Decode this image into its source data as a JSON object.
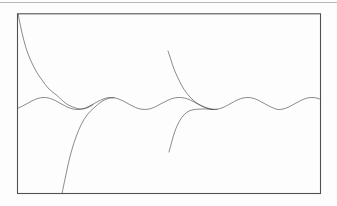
{
  "page": {
    "background": "#fdfdfd",
    "width": 337,
    "height": 206
  },
  "rule": {
    "x1": 0,
    "x2": 337,
    "y": 2.5,
    "color": "#b6b6b6",
    "width": 1
  },
  "figure_frame": {
    "x": 17.5,
    "y": 13.8,
    "width": 303,
    "height": 179.7,
    "stroke": "#515151",
    "stroke_width": 1.1
  },
  "chart_data": {
    "type": "line",
    "note": "Unlabeled line figure: periodic (sinusoidal) solution with four transient curves converging onto it; rectangular frame only, no axes, no ticks, no text.",
    "axes_visible": false,
    "grid": false,
    "legend": false,
    "units": "image pixels, y increases downward",
    "curve_color": "rgba(70,70,70,0.62)",
    "curve_width": 1,
    "series": [
      {
        "name": "periodic-solution",
        "points": [
          [
            18,
            108.1
          ],
          [
            23,
            105.8
          ],
          [
            28,
            103.1
          ],
          [
            33,
            100.4
          ],
          [
            38,
            98.4
          ],
          [
            43,
            97.5
          ],
          [
            48,
            97.9
          ],
          [
            53,
            99.5
          ],
          [
            58,
            102.0
          ],
          [
            63,
            104.8
          ],
          [
            68,
            107.3
          ],
          [
            73,
            109.0
          ],
          [
            78,
            109.5
          ],
          [
            83,
            108.7
          ],
          [
            88,
            106.8
          ],
          [
            93,
            104.2
          ],
          [
            98,
            101.4
          ],
          [
            103,
            99.1
          ],
          [
            108,
            97.7
          ],
          [
            113,
            97.6
          ],
          [
            118,
            98.8
          ],
          [
            123,
            100.9
          ],
          [
            128,
            103.6
          ],
          [
            133,
            106.3
          ],
          [
            138,
            108.4
          ],
          [
            143,
            109.4
          ],
          [
            148,
            109.2
          ],
          [
            153,
            107.8
          ],
          [
            158,
            105.4
          ],
          [
            163,
            102.7
          ],
          [
            168,
            100.2
          ],
          [
            173,
            98.3
          ],
          [
            178,
            97.5
          ],
          [
            183,
            97.8
          ],
          [
            188,
            99.1
          ],
          [
            193,
            101.4
          ],
          [
            198,
            104.1
          ],
          [
            203,
            106.7
          ],
          [
            208,
            108.6
          ],
          [
            213,
            109.5
          ],
          [
            218,
            109.1
          ],
          [
            223,
            107.5
          ],
          [
            228,
            105.0
          ],
          [
            233,
            102.2
          ],
          [
            238,
            99.7
          ],
          [
            243,
            98.0
          ],
          [
            248,
            97.5
          ],
          [
            253,
            98.2
          ],
          [
            258,
            100.1
          ],
          [
            263,
            102.8
          ],
          [
            268,
            105.5
          ],
          [
            273,
            107.9
          ],
          [
            278,
            109.5
          ],
          [
            283,
            109.0
          ],
          [
            288,
            107.3
          ],
          [
            293,
            104.7
          ],
          [
            298,
            102.0
          ],
          [
            303,
            99.5
          ],
          [
            308,
            97.9
          ],
          [
            313,
            97.5
          ],
          [
            318,
            98.4
          ],
          [
            320.5,
            99.3
          ]
        ]
      },
      {
        "name": "upper-left-transient",
        "points": [
          [
            18.2,
            14.2
          ],
          [
            20.5,
            26
          ],
          [
            23.5,
            39
          ],
          [
            27,
            51
          ],
          [
            31,
            61
          ],
          [
            36,
            71
          ],
          [
            42,
            80
          ],
          [
            49,
            89
          ],
          [
            57,
            95.5
          ],
          [
            66,
            103.5
          ],
          [
            75,
            107.8
          ],
          [
            82,
            109.0
          ],
          [
            88,
            107.5
          ],
          [
            93,
            104.8
          ]
        ]
      },
      {
        "name": "lower-left-transient",
        "points": [
          [
            62,
            193.7
          ],
          [
            65,
            179
          ],
          [
            68,
            165
          ],
          [
            71.5,
            151
          ],
          [
            76,
            137
          ],
          [
            81,
            125
          ],
          [
            87,
            115
          ],
          [
            94,
            107.8
          ],
          [
            101,
            102
          ],
          [
            107.5,
            98.7
          ],
          [
            114,
            97.7
          ]
        ]
      },
      {
        "name": "mid-upper-transient",
        "points": [
          [
            168,
            51
          ],
          [
            171,
            60
          ],
          [
            174,
            69
          ],
          [
            178,
            78
          ],
          [
            182,
            86
          ],
          [
            187,
            93.5
          ],
          [
            193,
            100
          ],
          [
            199,
            104.5
          ],
          [
            205,
            107.2
          ],
          [
            211,
            109.0
          ],
          [
            217,
            109.3
          ]
        ]
      },
      {
        "name": "mid-lower-transient",
        "points": [
          [
            169,
            152
          ],
          [
            172,
            141
          ],
          [
            175,
            131
          ],
          [
            179,
            122
          ],
          [
            183,
            116
          ],
          [
            188,
            111.5
          ],
          [
            194,
            109.6
          ],
          [
            200,
            109.1
          ],
          [
            207,
            109.0
          ],
          [
            213,
            109.6
          ]
        ]
      }
    ]
  }
}
